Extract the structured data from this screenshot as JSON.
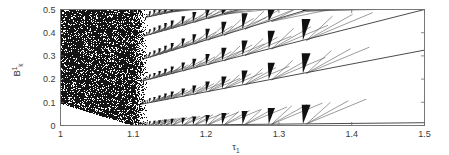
{
  "figure": {
    "type": "bifurcation-diagram",
    "background_color": "#ffffff",
    "axis_color": "#6b6b6b",
    "data_color": "#1a1a1a"
  },
  "axes": {
    "xlabel_base": "τ",
    "xlabel_sub": "1",
    "ylabel_base": "B",
    "ylabel_sup": "1",
    "ylabel_sub": "k",
    "x_ticks": [
      "1",
      "1.1",
      "1.2",
      "1.3",
      "1.4",
      "1.5"
    ],
    "x_tick_values": [
      1,
      1.1,
      1.2,
      1.3,
      1.4,
      1.5
    ],
    "y_ticks": [
      "0",
      "0.1",
      "0.2",
      "0.3",
      "0.4",
      "0.5"
    ],
    "y_tick_values": [
      0,
      0.1,
      0.2,
      0.3,
      0.4,
      0.5
    ]
  },
  "chart_data": {
    "type": "scatter",
    "title": "",
    "xlabel": "τ₁",
    "ylabel": "B¹ₖ",
    "xlim": [
      1.0,
      1.5
    ],
    "ylim": [
      0.0,
      0.5
    ],
    "grid": false,
    "legend": "none",
    "chaotic_region": {
      "x_range": [
        1.0,
        1.118
      ],
      "y_range": [
        0.0,
        0.5
      ],
      "lower_boundary_points": [
        [
          1.0,
          0.1
        ],
        [
          1.104,
          0.0
        ]
      ],
      "fill": "dense-speckle-black",
      "density": 0.82
    },
    "diagonal_bands": [
      {
        "name": "band-1",
        "x0": 1.104,
        "y0": 0.0,
        "x1": 1.5,
        "y1": 0.012
      },
      {
        "name": "band-2",
        "x0": 1.108,
        "y0": 0.09,
        "x1": 1.5,
        "y1": 0.325
      },
      {
        "name": "band-3",
        "x0": 1.11,
        "y0": 0.19,
        "x1": 1.5,
        "y1": 0.5
      },
      {
        "name": "band-4",
        "x0": 1.112,
        "y0": 0.285,
        "x1": 1.34,
        "y1": 0.5
      },
      {
        "name": "band-5",
        "x0": 1.114,
        "y0": 0.385,
        "x1": 1.245,
        "y1": 0.5
      },
      {
        "name": "band-6",
        "x0": 1.116,
        "y0": 0.465,
        "x1": 1.165,
        "y1": 0.5
      }
    ],
    "tongue_x_positions": [
      1.122,
      1.128,
      1.135,
      1.143,
      1.152,
      1.167,
      1.182,
      1.2,
      1.222,
      1.25,
      1.286,
      1.333
    ],
    "tongue_heights_rel": [
      0.018,
      0.02,
      0.022,
      0.025,
      0.028,
      0.032,
      0.036,
      0.042,
      0.05,
      0.058,
      0.07,
      0.082
    ],
    "tongue_widths_rel": [
      0.0025,
      0.003,
      0.0032,
      0.0035,
      0.004,
      0.0045,
      0.005,
      0.0055,
      0.0065,
      0.0075,
      0.009,
      0.011
    ],
    "fan_lines_per_tongue": 3
  }
}
